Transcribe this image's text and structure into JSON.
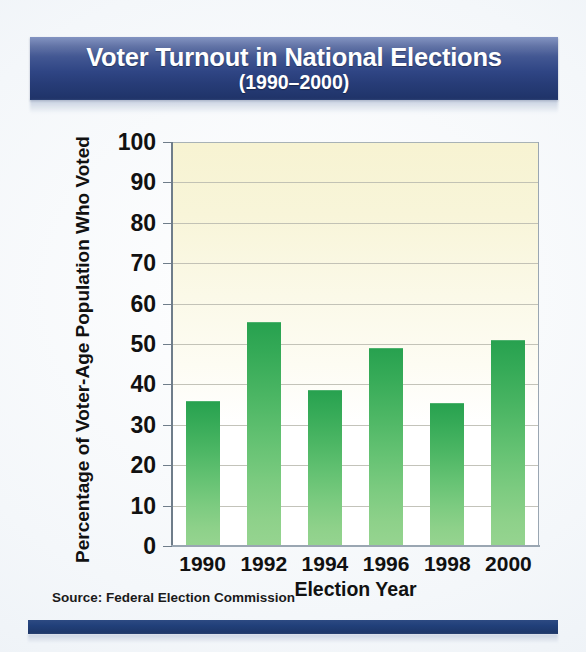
{
  "banner": {
    "title_line1": "Voter Turnout in National Elections",
    "title_line2": "(1990–2000)"
  },
  "source": {
    "text": "Source: Federal Election Commission"
  },
  "colors": {
    "banner_blue": "#2f4584",
    "bar_green_top": "#27a14f",
    "bar_green_bottom": "#96d490",
    "plot_cream": "#f7f3d2",
    "gridline": "#b9b9ae",
    "bottom_bar": "#21407a"
  },
  "chart_data": {
    "type": "bar",
    "title": "Voter Turnout in National Elections (1990–2000)",
    "xlabel": "Election Year",
    "ylabel": "Percentage of Voter-Age Population Who Voted",
    "categories": [
      "1990",
      "1992",
      "1994",
      "1996",
      "1998",
      "2000"
    ],
    "values": [
      36,
      55.5,
      38.5,
      49,
      35.5,
      51
    ],
    "ylim": [
      0,
      100
    ],
    "ytick_labels": [
      "0",
      "10",
      "20",
      "30",
      "40",
      "50",
      "60",
      "70",
      "80",
      "90",
      "100"
    ],
    "ytick_values": [
      0,
      10,
      20,
      30,
      40,
      50,
      60,
      70,
      80,
      90,
      100
    ],
    "grid": true,
    "legend": "none",
    "source": "Source: Federal Election Commission"
  }
}
